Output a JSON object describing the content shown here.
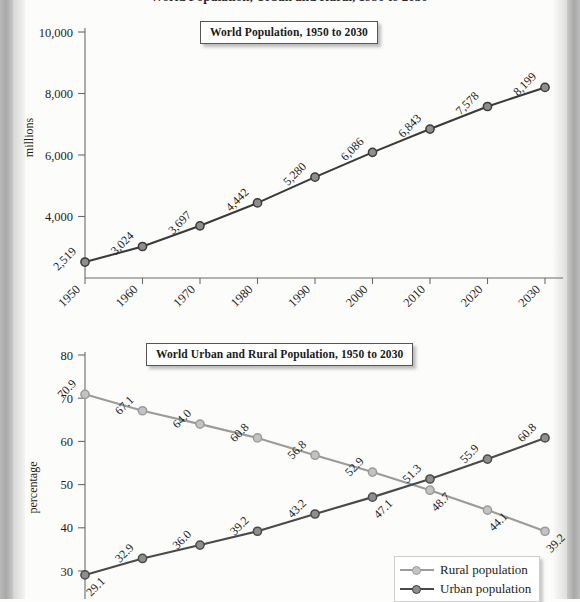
{
  "page": {
    "cut_off_header": "World Population, Urban and Rural, 1950 to 2030"
  },
  "chart_data": [
    {
      "id": "world-population",
      "type": "line",
      "title": "World Population, 1950 to 2030",
      "xlabel": "",
      "ylabel": "millions",
      "categories": [
        "1950",
        "1960",
        "1970",
        "1980",
        "1990",
        "2000",
        "2010",
        "2020",
        "2030"
      ],
      "values": [
        2519,
        3024,
        3697,
        4442,
        5280,
        6086,
        6843,
        7578,
        8199
      ],
      "point_labels": [
        "2,519",
        "3,024",
        "3,697",
        "4,442",
        "5,280",
        "6,086",
        "6,843",
        "7,578",
        "8,199"
      ],
      "yticks": [
        4000,
        6000,
        8000,
        10000
      ],
      "ytick_labels": [
        "4,000",
        "6,000",
        "8,000",
        "10,000"
      ],
      "ylim": [
        2000,
        10000
      ],
      "grid": false,
      "legend": "none",
      "series_color": "#3a3a3a",
      "marker_fill": "#8e8e8e"
    },
    {
      "id": "urban-rural-population",
      "type": "line",
      "title": "World Urban and Rural Population, 1950 to 2030",
      "xlabel": "",
      "ylabel": "percentage",
      "categories": [
        "1950",
        "1960",
        "1970",
        "1980",
        "1990",
        "2000",
        "2010",
        "2020",
        "2030"
      ],
      "yticks": [
        30,
        40,
        50,
        60,
        70,
        80
      ],
      "ytick_labels": [
        "30",
        "40",
        "50",
        "60",
        "70",
        "80"
      ],
      "ylim": [
        26,
        80
      ],
      "grid": false,
      "legend": "bottom-right",
      "series": [
        {
          "name": "Rural population",
          "color": "#9b9b9b",
          "marker_fill": "#c3c3c3",
          "values": [
            70.9,
            67.1,
            64.0,
            60.8,
            56.8,
            52.9,
            48.7,
            44.1,
            39.2
          ],
          "point_labels": [
            "70.9",
            "67.1",
            "64.0",
            "60.8",
            "56.8",
            "52.9",
            "48.7",
            "44.1",
            "39.2"
          ],
          "label_side": [
            "above",
            "above",
            "above",
            "above",
            "above",
            "above",
            "below",
            "below",
            "below"
          ]
        },
        {
          "name": "Urban population",
          "color": "#4a4a4a",
          "marker_fill": "#8e8e8e",
          "values": [
            29.1,
            32.9,
            36.0,
            39.2,
            43.2,
            47.1,
            51.3,
            55.9,
            60.8
          ],
          "point_labels": [
            "29.1",
            "32.9",
            "36.0",
            "39.2",
            "43.2",
            "47.1",
            "51.3",
            "55.9",
            "60.8"
          ],
          "label_side": [
            "below",
            "above",
            "above",
            "above",
            "above",
            "below",
            "above",
            "above",
            "above"
          ]
        }
      ]
    }
  ]
}
